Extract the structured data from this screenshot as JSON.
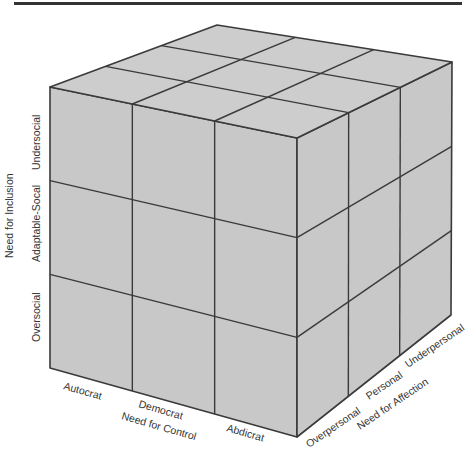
{
  "diagram": {
    "type": "3x3x3 cube",
    "colors": {
      "face": "#c8c8c8",
      "top": "#cdcdcd",
      "edge": "#3a3a3a",
      "text": "#333333"
    },
    "vertical_axis": {
      "title": "Need for Inclusion",
      "levels": [
        "Oversocial",
        "Adaptable-Socal",
        "Undersocial"
      ]
    },
    "front_axis": {
      "title": "Need for Control",
      "levels": [
        "Autocrat",
        "Democrat",
        "Abdicrat"
      ]
    },
    "right_axis": {
      "title": "Need for Affection",
      "levels": [
        "Overpersonal",
        "Personal",
        "Underpersonal"
      ]
    }
  }
}
